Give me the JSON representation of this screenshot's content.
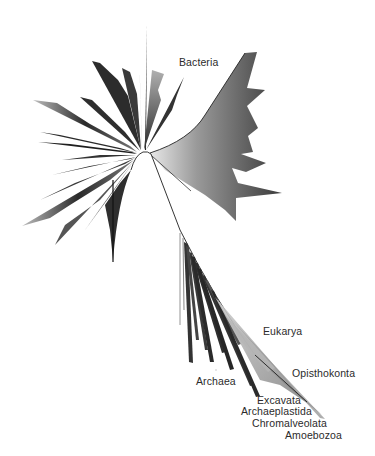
{
  "diagram": {
    "type": "unrooted phylogenetic tree",
    "colors": {
      "background": "#ffffff",
      "branch": "#1e1e1e",
      "label": "#2b2b2b"
    },
    "center": [
      143,
      152
    ],
    "labels": [
      {
        "id": "bacteria",
        "text": "Bacteria",
        "x": 179,
        "y": 56
      },
      {
        "id": "eukarya",
        "text": "Eukarya",
        "x": 263,
        "y": 325
      },
      {
        "id": "opisthokonta",
        "text": "Opisthokonta",
        "x": 292,
        "y": 367
      },
      {
        "id": "archaea",
        "text": "Archaea",
        "x": 196,
        "y": 375
      },
      {
        "id": "excavata",
        "text": "Excavata",
        "x": 257,
        "y": 394
      },
      {
        "id": "archaeplastida",
        "text": "Archaeplastida",
        "x": 241,
        "y": 405
      },
      {
        "id": "chromalveolata",
        "text": "Chromalveolata",
        "x": 252,
        "y": 417
      },
      {
        "id": "amoebozoa",
        "text": "Amoebozoa",
        "x": 285,
        "y": 429
      }
    ],
    "domains": [
      "Bacteria",
      "Archaea",
      "Eukarya"
    ],
    "eukaryote_supergroups": [
      "Opisthokonta",
      "Excavata",
      "Archaeplastida",
      "Chromalveolata",
      "Amoebozoa"
    ]
  }
}
